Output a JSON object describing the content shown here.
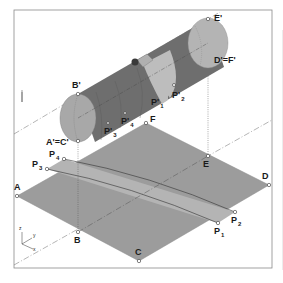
{
  "figure": {
    "colors": {
      "frame": "#8a8a8a",
      "plane_fill": "#9c9c9c",
      "strip_fill": "#b4b4b4",
      "cylinder_dark": "#6e6e6e",
      "cylinder_light": "#bdbdbd",
      "construction_line": "#6a6a6a"
    }
  },
  "points": {
    "A": {
      "label": "A"
    },
    "B": {
      "label": "B"
    },
    "C": {
      "label": "C"
    },
    "D": {
      "label": "D"
    },
    "E": {
      "label": "E"
    },
    "F": {
      "label": "F"
    },
    "P1": {
      "label": "P",
      "sub": "1"
    },
    "P2": {
      "label": "P",
      "sub": "2"
    },
    "P3": {
      "label": "P",
      "sub": "3"
    },
    "P4": {
      "label": "P",
      "sub": "4"
    },
    "Bp": {
      "label": "B'"
    },
    "ApCp": {
      "label": "A'=C'"
    },
    "Ep": {
      "label": "E'"
    },
    "DpFp": {
      "label": "D'=F'"
    },
    "P1p": {
      "label": "P'",
      "sub": "1"
    },
    "P2p": {
      "label": "P'",
      "sub": "2"
    },
    "P3p": {
      "label": "P'",
      "sub": "3"
    },
    "P4p": {
      "label": "P'",
      "sub": "4"
    }
  },
  "axes": {
    "z": "z",
    "y": "y",
    "x": "x"
  }
}
